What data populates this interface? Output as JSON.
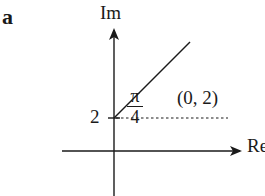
{
  "panel_label": "a",
  "axes": {
    "y_label": "Im",
    "x_label": "Re"
  },
  "marks": {
    "y_intercept_label": "2",
    "point_label": "(0, 2)"
  },
  "angle": {
    "numerator": "π",
    "denominator": "4"
  },
  "colors": {
    "ink": "#1a1a1a",
    "background": "#ffffff"
  }
}
